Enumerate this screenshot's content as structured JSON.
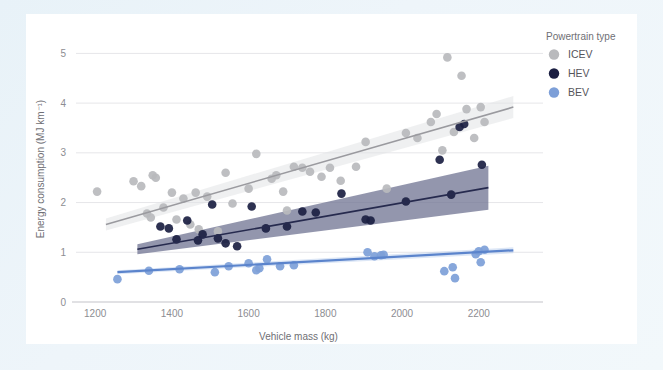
{
  "figure": {
    "background_color": "#eef5fa",
    "card_color": "#ffffff"
  },
  "legend": {
    "title": "Powertrain type",
    "position": "right",
    "entries": [
      {
        "label": "ICEV",
        "color": "#b9babd"
      },
      {
        "label": "HEV",
        "color": "#1b1f42"
      },
      {
        "label": "BEV",
        "color": "#7d9fd8"
      }
    ]
  },
  "chart_data": {
    "type": "scatter",
    "title": "",
    "xlabel": "Vehicle mass (kg)",
    "ylabel": "Energy consumption (MJ km⁻¹)",
    "xlim": [
      1150,
      2310
    ],
    "ylim": [
      0,
      5.35
    ],
    "xticks": [
      1200,
      1400,
      1600,
      1800,
      2000,
      2200
    ],
    "yticks": [
      0,
      1,
      2,
      3,
      4,
      5
    ],
    "xtick_labels": [
      "1200",
      "1400",
      "1600",
      "1800",
      "2000",
      "2200"
    ],
    "ytick_labels": [
      "0",
      "1",
      "2",
      "3",
      "4",
      "5"
    ],
    "grid": "horizontal",
    "legend_position": "right",
    "series": [
      {
        "name": "ICEV",
        "color": "#b9babd",
        "marker": "circle",
        "points": [
          [
            1205,
            2.22
          ],
          [
            1300,
            2.43
          ],
          [
            1320,
            2.33
          ],
          [
            1335,
            1.78
          ],
          [
            1345,
            1.7
          ],
          [
            1350,
            2.55
          ],
          [
            1358,
            2.5
          ],
          [
            1378,
            1.9
          ],
          [
            1400,
            2.2
          ],
          [
            1412,
            1.66
          ],
          [
            1430,
            2.08
          ],
          [
            1448,
            1.56
          ],
          [
            1462,
            2.2
          ],
          [
            1470,
            1.46
          ],
          [
            1492,
            2.12
          ],
          [
            1520,
            1.42
          ],
          [
            1540,
            2.6
          ],
          [
            1558,
            1.98
          ],
          [
            1600,
            2.28
          ],
          [
            1620,
            2.98
          ],
          [
            1660,
            2.48
          ],
          [
            1672,
            2.55
          ],
          [
            1690,
            2.22
          ],
          [
            1700,
            1.84
          ],
          [
            1718,
            2.72
          ],
          [
            1740,
            2.7
          ],
          [
            1760,
            2.62
          ],
          [
            1790,
            2.52
          ],
          [
            1812,
            2.7
          ],
          [
            1840,
            2.44
          ],
          [
            1880,
            2.72
          ],
          [
            1905,
            3.22
          ],
          [
            1960,
            2.28
          ],
          [
            2010,
            3.4
          ],
          [
            2040,
            3.3
          ],
          [
            2075,
            3.62
          ],
          [
            2090,
            3.78
          ],
          [
            2105,
            3.05
          ],
          [
            2118,
            4.92
          ],
          [
            2135,
            3.42
          ],
          [
            2155,
            4.55
          ],
          [
            2168,
            3.88
          ],
          [
            2188,
            3.3
          ],
          [
            2205,
            3.92
          ],
          [
            2215,
            3.62
          ]
        ],
        "fit_line": {
          "x": [
            1228,
            2290
          ],
          "y": [
            1.56,
            3.92
          ]
        },
        "band_color": "#e2e3e6"
      },
      {
        "name": "HEV",
        "color": "#1b1f42",
        "marker": "circle",
        "points": [
          [
            1370,
            1.52
          ],
          [
            1392,
            1.48
          ],
          [
            1412,
            1.26
          ],
          [
            1440,
            1.64
          ],
          [
            1468,
            1.24
          ],
          [
            1480,
            1.36
          ],
          [
            1505,
            1.96
          ],
          [
            1520,
            1.28
          ],
          [
            1540,
            1.18
          ],
          [
            1570,
            1.12
          ],
          [
            1608,
            1.92
          ],
          [
            1645,
            1.48
          ],
          [
            1700,
            1.52
          ],
          [
            1740,
            1.82
          ],
          [
            1775,
            1.8
          ],
          [
            1842,
            2.18
          ],
          [
            1905,
            1.66
          ],
          [
            1918,
            1.64
          ],
          [
            2010,
            2.02
          ],
          [
            2098,
            2.86
          ],
          [
            2128,
            2.16
          ],
          [
            2150,
            3.52
          ],
          [
            2162,
            3.58
          ],
          [
            2208,
            2.76
          ]
        ],
        "fit_line": {
          "x": [
            1310,
            2225
          ],
          "y": [
            1.06,
            2.3
          ]
        },
        "band_color": "#6f7391"
      },
      {
        "name": "BEV",
        "color": "#7d9fd8",
        "marker": "circle",
        "points": [
          [
            1258,
            0.46
          ],
          [
            1340,
            0.63
          ],
          [
            1420,
            0.66
          ],
          [
            1512,
            0.6
          ],
          [
            1548,
            0.72
          ],
          [
            1600,
            0.78
          ],
          [
            1620,
            0.64
          ],
          [
            1628,
            0.68
          ],
          [
            1648,
            0.86
          ],
          [
            1682,
            0.72
          ],
          [
            1718,
            0.74
          ],
          [
            1910,
            1.0
          ],
          [
            1928,
            0.92
          ],
          [
            1945,
            0.94
          ],
          [
            1952,
            0.95
          ],
          [
            2110,
            0.62
          ],
          [
            2132,
            0.7
          ],
          [
            2138,
            0.48
          ],
          [
            2192,
            0.96
          ],
          [
            2200,
            1.02
          ],
          [
            2205,
            0.8
          ],
          [
            2215,
            1.05
          ]
        ],
        "fit_line": {
          "x": [
            1258,
            2290
          ],
          "y": [
            0.6,
            1.04
          ]
        },
        "band_color": "#9fbbe6"
      }
    ]
  }
}
